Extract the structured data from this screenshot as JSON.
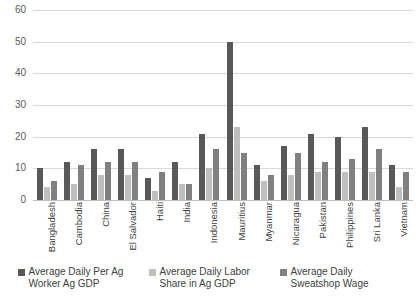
{
  "chart_data": {
    "type": "bar",
    "title": "",
    "xlabel": "",
    "ylabel": "",
    "ylim": [
      0,
      60
    ],
    "yticks": [
      0,
      10,
      20,
      30,
      40,
      50,
      60
    ],
    "grid": true,
    "legend_position": "bottom",
    "categories": [
      "Bangladesh",
      "Cambodia",
      "China",
      "El Salvador",
      "Haiti",
      "India",
      "Indonesia",
      "Mauritius",
      "Myanmar",
      "Nicaragua",
      "Pakistan",
      "Philippines",
      "Sri Lanka",
      "Vietnam"
    ],
    "series": [
      {
        "name": "Average Daily Per Ag Worker Ag GDP",
        "color": "#595959",
        "values": [
          10,
          12,
          16,
          16,
          7,
          12,
          21,
          50,
          11,
          17,
          21,
          20,
          23,
          11
        ]
      },
      {
        "name": "Average Daily Labor Share in Ag GDP",
        "color": "#bfbfbf",
        "values": [
          4,
          5,
          8,
          8,
          3,
          5,
          10,
          23,
          6,
          8,
          9,
          9,
          9,
          4
        ]
      },
      {
        "name": "Average Daily Sweatshop Wage",
        "color": "#808080",
        "values": [
          6,
          11,
          12,
          12,
          9,
          5,
          16,
          15,
          8,
          15,
          12,
          13,
          16,
          9
        ]
      }
    ]
  }
}
